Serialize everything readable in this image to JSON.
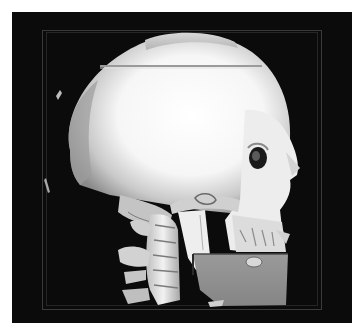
{
  "image": {
    "subject": "3D CT volume rendering of skull and cervical spine, lateral view facing right",
    "background_color": "#0b0b0b",
    "page_background": "#ffffff",
    "bone_colors": {
      "highlight": "#ffffff",
      "mid": "#c8c8c8",
      "shadow": "#7a7a7a"
    },
    "cut_plane_color": "#8e8e8e",
    "frame_color": "#3a3a3a"
  },
  "caption": ""
}
